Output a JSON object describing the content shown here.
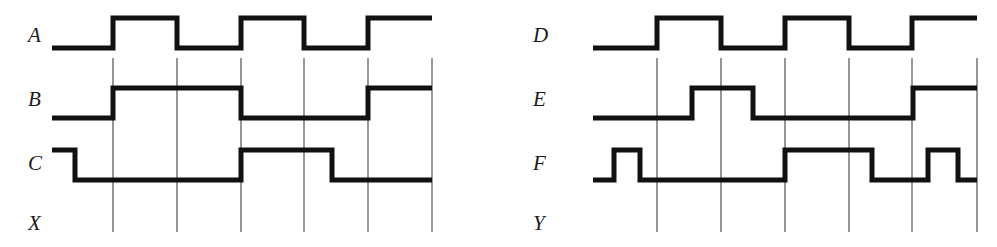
{
  "figure": {
    "type": "digital-timing-diagram",
    "background_color": "#ffffff",
    "waveform_color": "#111111",
    "gridline_color": "#6b6b6b",
    "waveform_stroke_px": 5,
    "gridline_stroke_px": 1.4,
    "width_px": 997,
    "height_px": 247
  },
  "panels": [
    {
      "id": "left",
      "name": "timing-panel-left",
      "origin_x": 0,
      "label_x": 28,
      "wave_start_x": 52,
      "wave_end_x": 432,
      "gridlines_x": [
        113,
        177,
        241,
        304,
        368,
        432
      ],
      "gridline_top_y": 58,
      "gridline_bottom_y": 232,
      "signals": [
        {
          "name": "A",
          "label": "A",
          "label_y": 36,
          "high_y": 18,
          "low_y": 48,
          "initial_level": 0,
          "edges_x": [
            113,
            177,
            241,
            304,
            368
          ],
          "levels": [
            0,
            1,
            0,
            1,
            0,
            1
          ]
        },
        {
          "name": "B",
          "label": "B",
          "label_y": 100,
          "high_y": 88,
          "low_y": 118,
          "initial_level": 0,
          "edges_x": [
            113,
            241,
            368
          ],
          "levels": [
            0,
            1,
            0,
            1
          ]
        },
        {
          "name": "C",
          "label": "C",
          "label_y": 164,
          "high_y": 150,
          "low_y": 180,
          "initial_level": 1,
          "edges_x": [
            75,
            241,
            332
          ],
          "levels": [
            1,
            0,
            1,
            0
          ]
        },
        {
          "name": "X",
          "label": "X",
          "label_y": 224,
          "output_only": true
        }
      ]
    },
    {
      "id": "right",
      "name": "timing-panel-right",
      "origin_x": 497,
      "label_x": 533,
      "wave_start_x": 593,
      "wave_end_x": 977,
      "gridlines_x": [
        657,
        721,
        785,
        849,
        912,
        977
      ],
      "gridline_top_y": 58,
      "gridline_bottom_y": 232,
      "signals": [
        {
          "name": "D",
          "label": "D",
          "label_y": 36,
          "high_y": 18,
          "low_y": 48,
          "initial_level": 0,
          "edges_x": [
            657,
            721,
            785,
            849,
            912
          ],
          "levels": [
            0,
            1,
            0,
            1,
            0,
            1
          ]
        },
        {
          "name": "E",
          "label": "E",
          "label_y": 100,
          "high_y": 88,
          "low_y": 118,
          "initial_level": 0,
          "edges_x": [
            692,
            753,
            913
          ],
          "levels": [
            0,
            1,
            0,
            1
          ]
        },
        {
          "name": "F",
          "label": "F",
          "label_y": 164,
          "high_y": 150,
          "low_y": 180,
          "initial_level": 0,
          "edges_x": [
            614,
            640,
            785,
            872,
            928,
            958
          ],
          "levels": [
            0,
            1,
            0,
            1,
            0,
            1,
            0
          ]
        },
        {
          "name": "Y",
          "label": "Y",
          "label_y": 224,
          "output_only": true
        }
      ]
    }
  ],
  "labels": {
    "left": [
      "A",
      "B",
      "C",
      "X"
    ],
    "right": [
      "D",
      "E",
      "F",
      "Y"
    ]
  }
}
